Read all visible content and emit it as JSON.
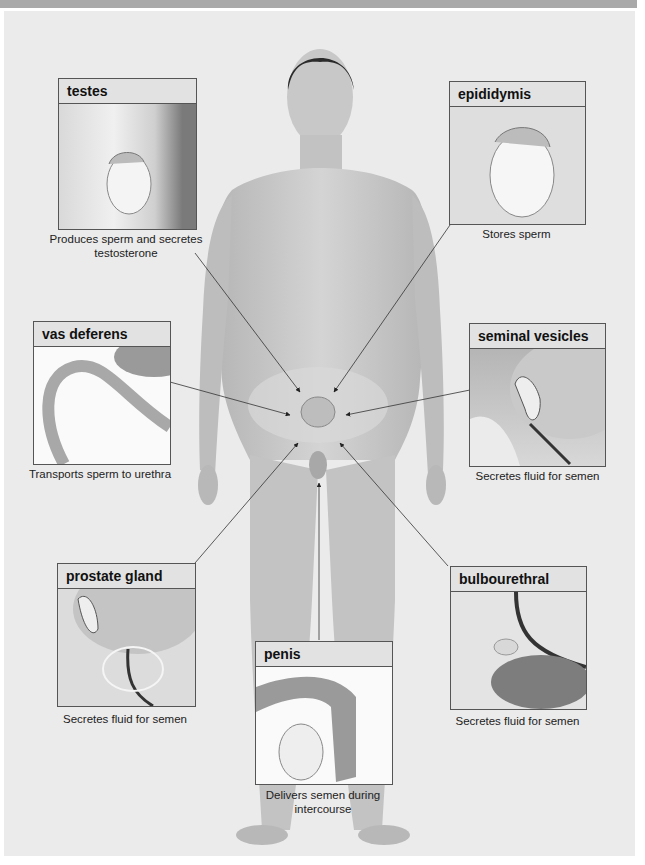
{
  "figure": {
    "organs": [
      {
        "name": "testes",
        "function": "Produces sperm and secretes testosterone",
        "function_l1": "Produces sperm and secretes",
        "function_l2": "testosterone"
      },
      {
        "name": "epididymis",
        "function": "Stores sperm"
      },
      {
        "name": "vas deferens",
        "function": "Transports sperm to urethra"
      },
      {
        "name": "seminal vesicles",
        "function": "Secretes fluid for semen"
      },
      {
        "name": "prostate gland",
        "function": "Secretes fluid for semen"
      },
      {
        "name": "bulbourethral gland",
        "function": "Secretes fluid for semen"
      },
      {
        "name": "penis",
        "function": "Delivers semen during intercourse",
        "function_l1": "Delivers semen during",
        "function_l2": "intercourse"
      }
    ]
  },
  "colors": {
    "background": "#ebebeb",
    "header_fill": "#e2e2e2",
    "border": "#555555",
    "skin": "#c9c9c9"
  }
}
